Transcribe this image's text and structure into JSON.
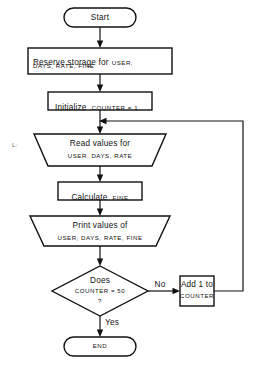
{
  "diagram": {
    "label_marker": "L:",
    "colors": {
      "stroke": "#111111",
      "background": "#ffffff",
      "text": "#111111"
    },
    "nodes": {
      "start": {
        "type": "terminator",
        "text": "Start"
      },
      "reserve": {
        "type": "process",
        "line1": "Reserve storage for",
        "line1_vars": "USER,",
        "line2": "DAYS, RATE, FINE"
      },
      "initialize": {
        "type": "process",
        "line1": "Initialize",
        "line1_vars": "COUNTER = 1"
      },
      "read": {
        "type": "io-trapezoid",
        "line1": "Read values for",
        "line2": "USER, DAYS, RATE"
      },
      "calculate": {
        "type": "process",
        "line1": "Calculate",
        "line1_vars": "FINE"
      },
      "print": {
        "type": "io-trapezoid",
        "line1": "Print values of",
        "line2": "USER, DAYS, RATE, FINE"
      },
      "decision": {
        "type": "decision",
        "line1": "Does",
        "line2": "COUNTER = 50",
        "line3": "?"
      },
      "increment": {
        "type": "process",
        "line1": "Add 1 to",
        "line2": "COUNTER"
      },
      "end": {
        "type": "terminator",
        "text": "END"
      }
    },
    "edge_labels": {
      "no": "No",
      "yes": "Yes"
    }
  }
}
